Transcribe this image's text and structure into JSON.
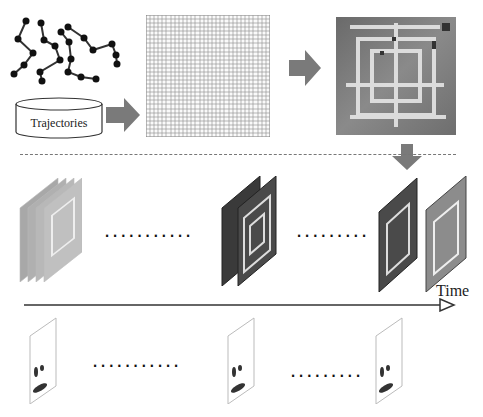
{
  "diagram": {
    "nodes": {
      "trajectories": {
        "label": "Trajectories",
        "icon": "database-cylinder-icon"
      },
      "grid": {
        "label": "",
        "icon": "grid-map-icon",
        "rows": 30,
        "cols": 30
      },
      "heatmap": {
        "label": "",
        "icon": "heatmap-icon"
      },
      "time_axis": {
        "label": "Time"
      }
    },
    "ellipsis": {
      "row1_left": "...........",
      "row1_right": ".........",
      "row2_left": "...........",
      "row2_right": "........."
    },
    "colors": {
      "arrow_gray": "#7a7a7a",
      "grid_line": "#8a8a8a",
      "dash_line": "#777777",
      "heatmap_dark": "#4a4a4a",
      "heatmap_light": "#d9d9d9",
      "point": "#111111"
    }
  }
}
